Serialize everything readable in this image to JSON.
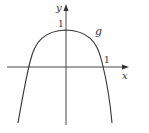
{
  "figure": {
    "axes": {
      "x_label": "x",
      "y_label": "y"
    },
    "ticks": {
      "y_tick_label": "1",
      "x_tick_label": "1"
    },
    "curve": {
      "name": "g",
      "description": "even function with maximum 1 at x=0, crossing x-axis near x=±1, decreasing steeply to -infinity"
    },
    "colors": {
      "stroke": "#333333",
      "background": "#ffffff"
    }
  }
}
